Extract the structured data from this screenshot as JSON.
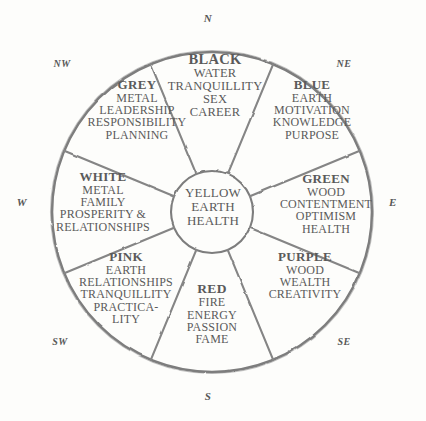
{
  "diagram": {
    "ink_color": "#7f7f7f",
    "paper_color": "#fdfdfb",
    "text_color": "#5a5a5a"
  },
  "compass": {
    "n": "N",
    "ne": "NE",
    "e": "E",
    "se": "SE",
    "s": "S",
    "sw": "SW",
    "w": "W",
    "nw": "NW"
  },
  "center": {
    "lines": [
      "YELLOW",
      "EARTH",
      "HEALTH"
    ]
  },
  "sectors": [
    {
      "id": "black",
      "direction": "N",
      "header": "BLACK",
      "lines": [
        "WATER",
        "TRANQUILLITY",
        "SEX",
        "CAREER"
      ]
    },
    {
      "id": "grey",
      "direction": "NW",
      "header": "GREY",
      "lines": [
        "METAL",
        "LEADERSHIP",
        "RESPONSIBILITY",
        "PLANNING"
      ]
    },
    {
      "id": "blue",
      "direction": "NE",
      "header": "BLUE",
      "lines": [
        "EARTH",
        "MOTIVATION",
        "KNOWLEDGE",
        "PURPOSE"
      ]
    },
    {
      "id": "green",
      "direction": "E",
      "header": "GREEN",
      "lines": [
        "WOOD",
        "CONTENTMENT",
        "OPTIMISM",
        "HEALTH"
      ]
    },
    {
      "id": "purple",
      "direction": "SE",
      "header": "PURPLE",
      "lines": [
        "WOOD",
        "WEALTH",
        "CREATIVITY"
      ]
    },
    {
      "id": "red",
      "direction": "S",
      "header": "RED",
      "lines": [
        "FIRE",
        "ENERGY",
        "PASSION",
        "FAME"
      ]
    },
    {
      "id": "pink",
      "direction": "SW",
      "header": "PINK",
      "lines": [
        "EARTH",
        "RELATIONSHIPS",
        "TRANQUILLITY",
        "PRACTICA-",
        "LITY"
      ]
    },
    {
      "id": "white",
      "direction": "W",
      "header": "WHITE",
      "lines": [
        "METAL",
        "FAMILY",
        "PROSPERITY &",
        "RELATIONSHIPS"
      ]
    }
  ]
}
